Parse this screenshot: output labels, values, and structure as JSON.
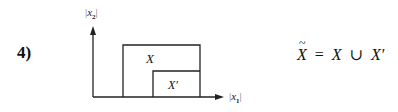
{
  "item_number": "4)",
  "diagram": {
    "y_axis_label": {
      "bar_left": "|",
      "var": "x",
      "sub": "2",
      "bar_right": "|"
    },
    "x_axis_label": {
      "bar_left": "|",
      "var": "x",
      "sub": "1",
      "bar_right": "|"
    },
    "outer_set_label": "X",
    "inner_set_label": "X′"
  },
  "formula": {
    "lhs": "X",
    "equals": "=",
    "term1": "X",
    "union": "∪",
    "term2": "X′"
  }
}
